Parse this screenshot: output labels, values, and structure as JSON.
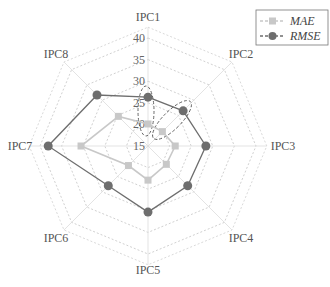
{
  "chart_data": {
    "type": "radar",
    "title": "",
    "axes": [
      "IPC1",
      "IPC2",
      "IPC3",
      "IPC4",
      "IPC5",
      "IPC6",
      "IPC7",
      "IPC8"
    ],
    "radial_ticks": [
      15,
      20,
      25,
      30,
      35,
      40
    ],
    "rlim": [
      15,
      40
    ],
    "grid": true,
    "legend_position": "top-right",
    "series": [
      {
        "name": "MAE",
        "marker": "square",
        "color": "#c8c8c8",
        "values": [
          20.1,
          19.7,
          21.3,
          21.0,
          22.9,
          21.4,
          30.5,
          24.7
        ]
      },
      {
        "name": "RMSE",
        "marker": "circle",
        "color": "#6e6e6e",
        "values": [
          26.3,
          26.5,
          28.4,
          28.0,
          30.3,
          28.0,
          38.1,
          31.7
        ]
      }
    ],
    "annotations": [
      {
        "type": "dashed-ellipse",
        "around": "IPC1 MAE/RMSE"
      },
      {
        "type": "dashed-ellipse",
        "around": "IPC2 MAE/RMSE"
      }
    ]
  },
  "legend": {
    "items": [
      {
        "label": "MAE"
      },
      {
        "label": "RMSE"
      }
    ]
  }
}
